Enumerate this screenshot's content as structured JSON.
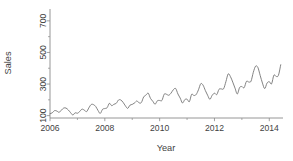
{
  "chart_data": {
    "type": "line",
    "title": "",
    "subtitle": "",
    "xlabel": "Year",
    "ylabel": "Sales",
    "xlim": [
      2006.0,
      2014.5
    ],
    "ylim": [
      85,
      775
    ],
    "grid": false,
    "legend": null,
    "annotations": [],
    "xticks": [
      2006,
      2008,
      2010,
      2012,
      2014
    ],
    "xticklabels": [
      "2006",
      "2008",
      "2010",
      "2012",
      "2014"
    ],
    "yticks": [
      100,
      300,
      500,
      700
    ],
    "yticklabels": [
      "100",
      "300",
      "500",
      "700"
    ],
    "yticks_minor": [
      200,
      400,
      600
    ],
    "xticks_minor": [
      2007,
      2009,
      2011,
      2013
    ],
    "line_color": "#6d6d6d",
    "axis_color": "#8a8a8a",
    "background": "#ffffff",
    "series": [
      {
        "name": "Sales",
        "x": [
          2006.0,
          2006.083,
          2006.167,
          2006.25,
          2006.333,
          2006.417,
          2006.5,
          2006.583,
          2006.667,
          2006.75,
          2006.833,
          2006.917,
          2007.0,
          2007.083,
          2007.167,
          2007.25,
          2007.333,
          2007.417,
          2007.5,
          2007.583,
          2007.667,
          2007.75,
          2007.833,
          2007.917,
          2008.0,
          2008.083,
          2008.167,
          2008.25,
          2008.333,
          2008.417,
          2008.5,
          2008.583,
          2008.667,
          2008.75,
          2008.833,
          2008.917,
          2009.0,
          2009.083,
          2009.167,
          2009.25,
          2009.333,
          2009.417,
          2009.5,
          2009.583,
          2009.667,
          2009.75,
          2009.833,
          2009.917,
          2010.0,
          2010.083,
          2010.167,
          2010.25,
          2010.333,
          2010.417,
          2010.5,
          2010.583,
          2010.667,
          2010.75,
          2010.833,
          2010.917,
          2011.0,
          2011.083,
          2011.167,
          2011.25,
          2011.333,
          2011.417,
          2011.5,
          2011.583,
          2011.667,
          2011.75,
          2011.833,
          2011.917,
          2012.0,
          2012.083,
          2012.167,
          2012.25,
          2012.333,
          2012.417,
          2012.5,
          2012.583,
          2012.667,
          2012.75,
          2012.833,
          2012.917,
          2013.0,
          2013.083,
          2013.167,
          2013.25,
          2013.333,
          2013.417,
          2013.5,
          2013.583,
          2013.667,
          2013.75,
          2013.833,
          2013.917,
          2014.0,
          2014.083,
          2014.167,
          2014.25,
          2014.333,
          2014.417
        ],
        "values": [
          112,
          118,
          132,
          129,
          121,
          135,
          148,
          148,
          136,
          119,
          104,
          118,
          115,
          126,
          141,
          135,
          125,
          149,
          170,
          170,
          158,
          133,
          114,
          140,
          145,
          150,
          178,
          163,
          172,
          178,
          199,
          199,
          184,
          162,
          146,
          166,
          171,
          180,
          193,
          181,
          183,
          218,
          230,
          242,
          209,
          191,
          172,
          194,
          196,
          196,
          236,
          235,
          229,
          243,
          264,
          272,
          237,
          211,
          180,
          201,
          204,
          188,
          235,
          227,
          234,
          264,
          302,
          293,
          259,
          229,
          203,
          229,
          242,
          233,
          267,
          269,
          270,
          315,
          364,
          347,
          312,
          274,
          237,
          278,
          284,
          277,
          317,
          313,
          318,
          374,
          413,
          405,
          355,
          306,
          271,
          306,
          315,
          301,
          356,
          348,
          355,
          422
        ]
      }
    ]
  },
  "axes": {
    "ylabel": "Sales",
    "xlabel": "Year"
  }
}
